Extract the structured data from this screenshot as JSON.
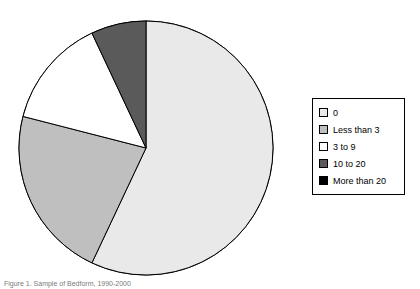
{
  "chart_data": {
    "type": "pie",
    "title": "",
    "xlabel": "",
    "ylabel": "",
    "legend_position": "right",
    "grid": false,
    "start_angle_deg": 0,
    "direction": "clockwise",
    "categories": [
      "0",
      "Less than 3",
      "3 to 9",
      "10 to 20",
      "More than 20"
    ],
    "values": [
      57,
      22,
      14,
      7,
      0
    ],
    "unit": "percent",
    "colors": [
      "#e9e9e9",
      "#bfbfbf",
      "#ffffff",
      "#5a5a5a",
      "#000000"
    ],
    "slice_edge_color": "#000000",
    "slices": [
      {
        "label": "0",
        "value": 57,
        "color": "#e9e9e9"
      },
      {
        "label": "Less than 3",
        "value": 22,
        "color": "#bfbfbf"
      },
      {
        "label": "3 to 9",
        "value": 14,
        "color": "#ffffff"
      },
      {
        "label": "10 to 20",
        "value": 7,
        "color": "#5a5a5a"
      },
      {
        "label": "More than 20",
        "value": 0,
        "color": "#000000"
      }
    ]
  },
  "legend": {
    "items": [
      {
        "label": "0",
        "color": "#e9e9e9"
      },
      {
        "label": "Less than 3",
        "color": "#bfbfbf"
      },
      {
        "label": "3 to 9",
        "color": "#ffffff"
      },
      {
        "label": "10 to 20",
        "color": "#5a5a5a"
      },
      {
        "label": "More than 20",
        "color": "#000000"
      }
    ],
    "border_color": "#000000"
  },
  "caption": {
    "text": "Figure 1. Sample of Bedform, 1990-2000"
  }
}
